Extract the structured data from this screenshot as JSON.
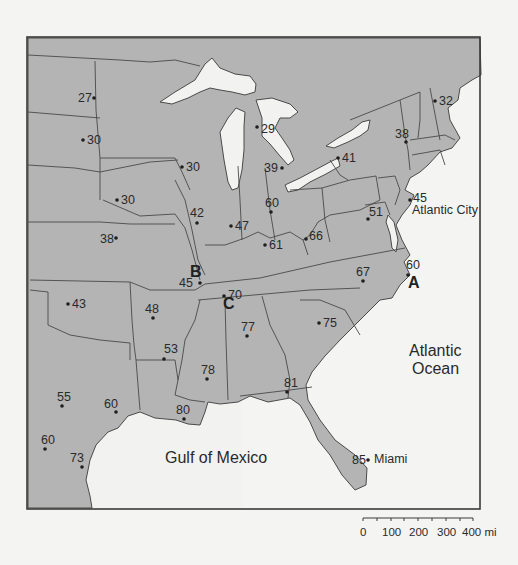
{
  "map": {
    "frame": {
      "x": 27,
      "y": 37,
      "width": 215,
      "height": 472
    },
    "colors": {
      "land": "#b4b4b4",
      "water": "#f2f2f0",
      "border": "#4a4a4a",
      "background": "#f4f4f2"
    },
    "water_labels": [
      {
        "id": "atlantic-ocean-line1",
        "text": "Atlantic",
        "x": 409,
        "y": 356
      },
      {
        "id": "atlantic-ocean-line2",
        "text": "Ocean",
        "x": 412,
        "y": 374
      },
      {
        "id": "gulf-of-mexico",
        "text": "Gulf of Mexico",
        "x": 165,
        "y": 463
      }
    ],
    "place_labels": [
      {
        "id": "atlantic-city",
        "text": "Atlantic City",
        "x": 412,
        "y": 214
      },
      {
        "id": "miami",
        "text": "Miami",
        "x": 374,
        "y": 463
      }
    ],
    "point_letters": [
      {
        "id": "A",
        "text": "A",
        "x": 408,
        "y": 288
      },
      {
        "id": "B",
        "text": "B",
        "x": 190,
        "y": 277
      },
      {
        "id": "C",
        "text": "C",
        "x": 223,
        "y": 309
      }
    ],
    "stations": [
      {
        "value": "27",
        "dot": [
          94,
          98
        ],
        "label": [
          78,
          102
        ]
      },
      {
        "value": "30",
        "dot": [
          83,
          140
        ],
        "label": [
          87,
          144
        ]
      },
      {
        "value": "30",
        "dot": [
          182,
          167
        ],
        "label": [
          186,
          171
        ]
      },
      {
        "value": "30",
        "dot": [
          117,
          200
        ],
        "label": [
          121,
          204
        ]
      },
      {
        "value": "38",
        "dot": [
          116,
          238
        ],
        "label": [
          100,
          243
        ]
      },
      {
        "value": "42",
        "dot": [
          197,
          223
        ],
        "label": [
          190,
          217
        ]
      },
      {
        "value": "47",
        "dot": [
          231,
          226
        ],
        "label": [
          235,
          230
        ]
      },
      {
        "value": "60",
        "dot": [
          271,
          212
        ],
        "label": [
          265,
          207
        ]
      },
      {
        "value": "61",
        "dot": [
          265,
          245
        ],
        "label": [
          269,
          249
        ]
      },
      {
        "value": "66",
        "dot": [
          306,
          239
        ],
        "label": [
          309,
          240
        ]
      },
      {
        "value": "51",
        "dot": [
          368,
          219
        ],
        "label": [
          369,
          216
        ]
      },
      {
        "value": "45",
        "dot": [
          410,
          200
        ],
        "label": [
          413,
          202
        ]
      },
      {
        "value": "29",
        "dot": [
          257,
          127
        ],
        "label": [
          261,
          133
        ]
      },
      {
        "value": "39",
        "dot": [
          282,
          168
        ],
        "label": [
          264,
          172
        ]
      },
      {
        "value": "41",
        "dot": [
          338,
          158
        ],
        "label": [
          342,
          162
        ]
      },
      {
        "value": "38",
        "dot": [
          406,
          142
        ],
        "label": [
          395,
          138
        ]
      },
      {
        "value": "32",
        "dot": [
          435,
          101
        ],
        "label": [
          439,
          105
        ]
      },
      {
        "value": "45",
        "dot": [
          200,
          283
        ],
        "label": [
          179,
          287
        ]
      },
      {
        "value": "70",
        "dot": [
          224,
          296
        ],
        "label": [
          228,
          299
        ]
      },
      {
        "value": "67",
        "dot": [
          363,
          281
        ],
        "label": [
          356,
          276
        ]
      },
      {
        "value": "60",
        "dot": [
          408,
          275
        ],
        "label": [
          406,
          269
        ]
      },
      {
        "value": "43",
        "dot": [
          68,
          304
        ],
        "label": [
          72,
          308
        ]
      },
      {
        "value": "48",
        "dot": [
          153,
          318
        ],
        "label": [
          145,
          313
        ]
      },
      {
        "value": "53",
        "dot": [
          164,
          359
        ],
        "label": [
          164,
          353
        ]
      },
      {
        "value": "77",
        "dot": [
          247,
          336
        ],
        "label": [
          241,
          331
        ]
      },
      {
        "value": "75",
        "dot": [
          319,
          323
        ],
        "label": [
          323,
          327
        ]
      },
      {
        "value": "78",
        "dot": [
          207,
          379
        ],
        "label": [
          201,
          374
        ]
      },
      {
        "value": "81",
        "dot": [
          287,
          392
        ],
        "label": [
          284,
          387
        ]
      },
      {
        "value": "80",
        "dot": [
          184,
          419
        ],
        "label": [
          176,
          414
        ]
      },
      {
        "value": "55",
        "dot": [
          62,
          406
        ],
        "label": [
          57,
          401
        ]
      },
      {
        "value": "60",
        "dot": [
          116,
          412
        ],
        "label": [
          104,
          408
        ]
      },
      {
        "value": "60",
        "dot": [
          45,
          449
        ],
        "label": [
          41,
          444
        ]
      },
      {
        "value": "73",
        "dot": [
          82,
          467
        ],
        "label": [
          70,
          462
        ]
      },
      {
        "value": "85",
        "dot": [
          368,
          460
        ],
        "label": [
          352,
          464
        ]
      }
    ]
  },
  "scale_bar": {
    "ticks": [
      "0",
      "100",
      "200",
      "300",
      "400 mi"
    ],
    "unit": "mi"
  }
}
